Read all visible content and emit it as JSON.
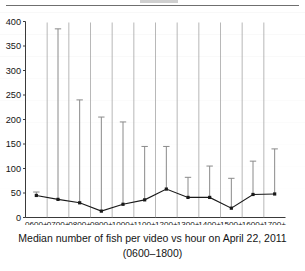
{
  "figure": {
    "caption_line1": "Median number of fish per video vs hour on April 22, 2011",
    "caption_line2": "(0600–1800)"
  },
  "chart_data": {
    "type": "line",
    "title": "",
    "subtitle": "",
    "xlabel": "",
    "ylabel": "",
    "categories": [
      "0600+",
      "0700+",
      "0800+",
      "0900+",
      "1000+",
      "1100+",
      "1200+",
      "1300+",
      "1400+",
      "1500+",
      "1600+",
      "1700+"
    ],
    "values": [
      45,
      37,
      30,
      13,
      27,
      36,
      58,
      41,
      41,
      19,
      47,
      48
    ],
    "error_upper": [
      52,
      385,
      240,
      205,
      195,
      145,
      145,
      82,
      105,
      80,
      115,
      140
    ],
    "error_direction": "upper-only",
    "ylim": [
      0,
      400
    ],
    "yticks": [
      0,
      50,
      100,
      150,
      200,
      250,
      300,
      350,
      400
    ],
    "ytick_labels": [
      "0",
      "50",
      "100",
      "150",
      "200",
      "250",
      "300",
      "350",
      "400"
    ],
    "grid": false,
    "legend": null,
    "marker": "square",
    "series_color": "#1a1a1a",
    "axis_color": "#3a3a3a",
    "errorbar_color": "#8a8a8a"
  }
}
